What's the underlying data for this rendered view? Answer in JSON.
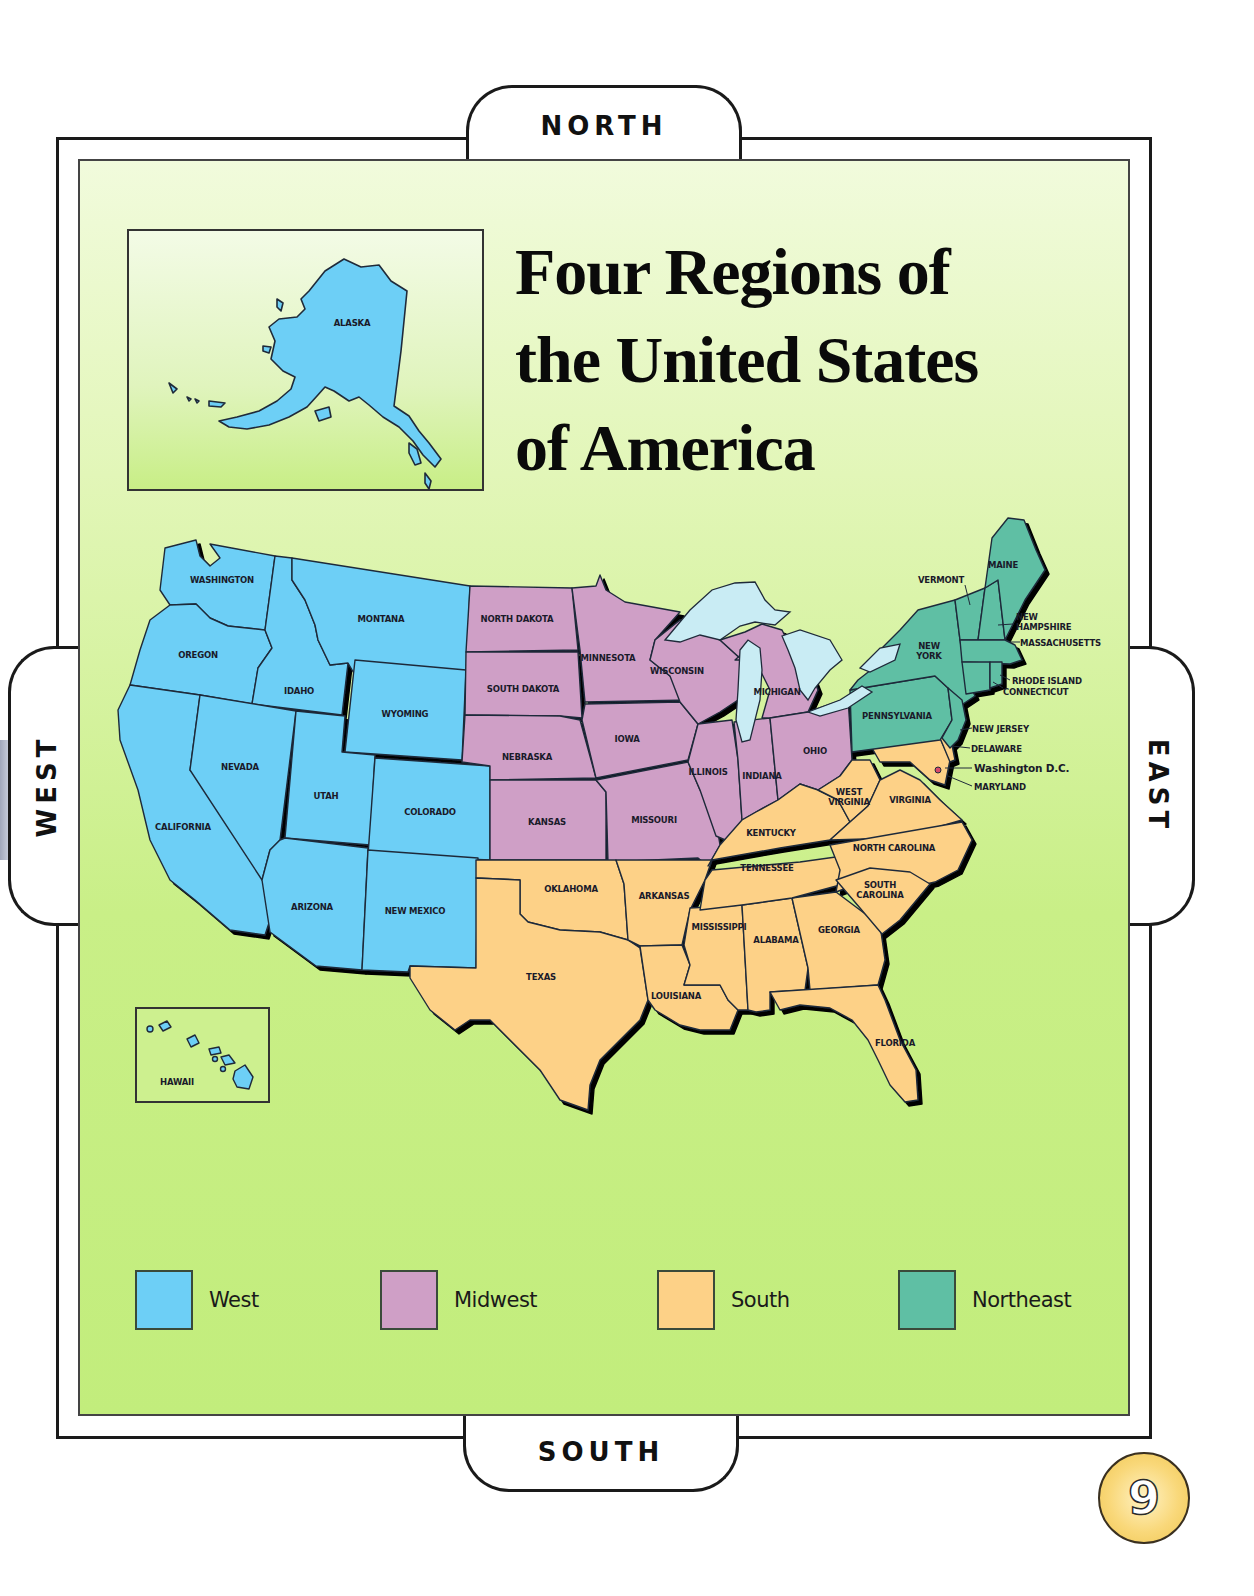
{
  "title": {
    "lines": [
      "Four Regions of",
      "the United States",
      "of America"
    ]
  },
  "compass": {
    "north": "NORTH",
    "south": "SOUTH",
    "east": "EAST",
    "west": "WEST"
  },
  "colors": {
    "west": "#6dcff6",
    "midwest": "#cf9fc6",
    "south": "#fdd187",
    "northeast": "#5fbfa4",
    "water": "#c9ecf4",
    "background_green": "#c6ee82",
    "outline": "#1f2a3a",
    "badge": "#f9d87a"
  },
  "insets": {
    "alaska": {
      "label": "ALASKA"
    },
    "hawaii": {
      "label": "HAWAII"
    }
  },
  "legend": [
    {
      "region": "west",
      "label": "West",
      "color": "#6dcff6"
    },
    {
      "region": "midwest",
      "label": "Midwest",
      "color": "#cf9fc6"
    },
    {
      "region": "south",
      "label": "South",
      "color": "#fdd187"
    },
    {
      "region": "northeast",
      "label": "Northeast",
      "color": "#5fbfa4"
    }
  ],
  "regions": {
    "west": [
      "WASHINGTON",
      "OREGON",
      "CALIFORNIA",
      "IDAHO",
      "NEVADA",
      "MONTANA",
      "WYOMING",
      "UTAH",
      "COLORADO",
      "ARIZONA",
      "NEW MEXICO",
      "ALASKA",
      "HAWAII"
    ],
    "midwest": [
      "NORTH DAKOTA",
      "SOUTH DAKOTA",
      "NEBRASKA",
      "KANSAS",
      "MINNESOTA",
      "IOWA",
      "MISSOURI",
      "WISCONSIN",
      "ILLINOIS",
      "MICHIGAN",
      "INDIANA",
      "OHIO"
    ],
    "south": [
      "OKLAHOMA",
      "TEXAS",
      "ARKANSAS",
      "LOUISIANA",
      "MISSISSIPPI",
      "ALABAMA",
      "TENNESSEE",
      "KENTUCKY",
      "WEST VIRGINIA",
      "VIRGINIA",
      "NORTH CAROLINA",
      "SOUTH CAROLINA",
      "GEORGIA",
      "FLORIDA",
      "MARYLAND",
      "DELAWARE",
      "Washington D.C."
    ],
    "northeast": [
      "MAINE",
      "VERMONT",
      "NEW HAMPSHIRE",
      "MASSACHUSETTS",
      "RHODE ISLAND",
      "CONNECTICUT",
      "NEW YORK",
      "PENNSYLVANIA",
      "NEW JERSEY"
    ]
  },
  "labels": {
    "washington": "WASHINGTON",
    "oregon": "OREGON",
    "california": "CALIFORNIA",
    "idaho": "IDAHO",
    "nevada": "NEVADA",
    "montana": "MONTANA",
    "wyoming": "WYOMING",
    "utah": "UTAH",
    "colorado": "COLORADO",
    "arizona": "ARIZONA",
    "new_mexico": "NEW MEXICO",
    "north_dakota": "NORTH DAKOTA",
    "south_dakota": "SOUTH DAKOTA",
    "nebraska": "NEBRASKA",
    "kansas": "KANSAS",
    "minnesota": "MINNESOTA",
    "iowa": "IOWA",
    "missouri": "MISSOURI",
    "wisconsin": "WISCONSIN",
    "illinois": "ILLINOIS",
    "michigan": "MICHIGAN",
    "indiana": "INDIANA",
    "ohio": "OHIO",
    "oklahoma": "OKLAHOMA",
    "texas": "TEXAS",
    "arkansas": "ARKANSAS",
    "louisiana": "LOUISIANA",
    "mississippi": "MISSISSIPPI",
    "alabama": "ALABAMA",
    "tennessee": "TENNESSEE",
    "kentucky": "KENTUCKY",
    "west_virginia_1": "WEST",
    "west_virginia_2": "VIRGINIA",
    "virginia": "VIRGINIA",
    "north_carolina": "NORTH CAROLINA",
    "south_carolina_1": "SOUTH",
    "south_carolina_2": "CAROLINA",
    "georgia": "GEORGIA",
    "florida": "FLORIDA",
    "maine": "MAINE",
    "vermont": "VERMONT",
    "new_hampshire_1": "NEW",
    "new_hampshire_2": "HAMPSHIRE",
    "massachusetts": "MASSACHUSETTS",
    "rhode_island": "RHODE ISLAND",
    "connecticut": "CONNECTICUT",
    "new_york_1": "NEW",
    "new_york_2": "YORK",
    "pennsylvania": "PENNSYLVANIA",
    "new_jersey": "NEW JERSEY",
    "delaware": "DELAWARE",
    "washington_dc": "Washington D.C.",
    "maryland": "MARYLAND"
  },
  "page_number": "9"
}
